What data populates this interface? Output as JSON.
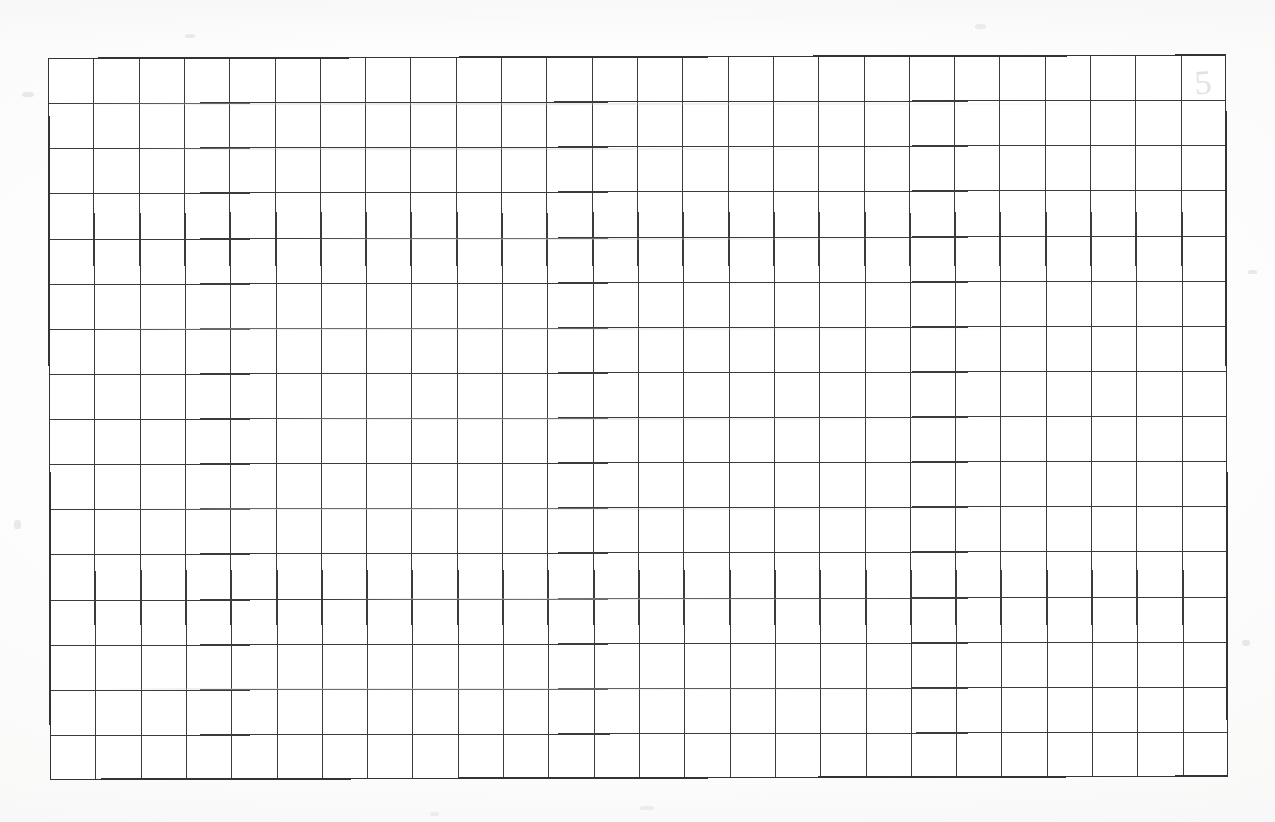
{
  "page": {
    "kind": "scanned-document-page",
    "background_color": "#fefefe",
    "width": 1275,
    "height": 822
  },
  "top_text_remnant": {
    "present": true,
    "text": "· · · · · · · · · · · ·",
    "description": "cut-off descenders of a line of text above the crop",
    "color": "#b9b9bc"
  },
  "grid": {
    "label": "blank-ruled-grid",
    "columns": 26,
    "rows": 16,
    "left": 48,
    "top": 58,
    "width": 1178,
    "height": 722,
    "cell_width": 45.3,
    "cell_height": 45.1,
    "line_color": "#3b3b3d",
    "border_color": "#333335",
    "fill_color": "#ffffff",
    "cells_filled": 0,
    "content": ""
  },
  "bleed_mark": {
    "text": "5",
    "color": "#dedee1",
    "cell_column": 26,
    "cell_row": 1,
    "description": "faint show-through digit from reverse side of sheet"
  },
  "artifacts": {
    "streaks": [
      {
        "x": 60,
        "y": 103,
        "width": 1110
      },
      {
        "x": 120,
        "y": 148,
        "width": 880
      },
      {
        "x": 300,
        "y": 238,
        "width": 700
      },
      {
        "x": 70,
        "y": 328,
        "width": 980
      },
      {
        "x": 240,
        "y": 418,
        "width": 820
      },
      {
        "x": 110,
        "y": 508,
        "width": 1000
      },
      {
        "x": 330,
        "y": 598,
        "width": 640
      },
      {
        "x": 90,
        "y": 688,
        "width": 920
      }
    ],
    "specks": [
      {
        "x": 22,
        "y": 92,
        "width": 12,
        "height": 5
      },
      {
        "x": 1248,
        "y": 270,
        "width": 9,
        "height": 4
      },
      {
        "x": 640,
        "y": 806,
        "width": 14,
        "height": 4
      },
      {
        "x": 185,
        "y": 34,
        "width": 10,
        "height": 4
      },
      {
        "x": 975,
        "y": 24,
        "width": 11,
        "height": 5
      },
      {
        "x": 1242,
        "y": 640,
        "width": 8,
        "height": 6
      },
      {
        "x": 14,
        "y": 520,
        "width": 7,
        "height": 9
      },
      {
        "x": 430,
        "y": 812,
        "width": 9,
        "height": 4
      }
    ]
  }
}
